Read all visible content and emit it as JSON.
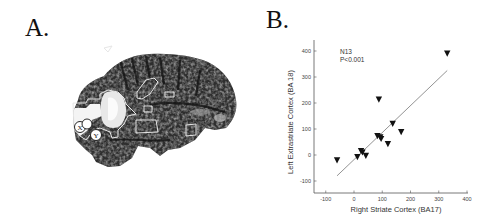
{
  "panels": {
    "a": {
      "label": "A.",
      "circle_labels": [
        "X",
        "Y"
      ]
    },
    "b": {
      "label": "B."
    }
  },
  "chart_data": {
    "type": "scatter",
    "title": "",
    "xlabel": "Right Striate Cortex (BA17)",
    "ylabel": "Left Extrastriate Cortex (BA 18)",
    "xlim": [
      -150,
      400
    ],
    "ylim": [
      -150,
      450
    ],
    "xticks": [
      -100,
      0,
      100,
      200,
      300,
      400
    ],
    "yticks": [
      -100,
      0,
      100,
      200,
      300,
      400
    ],
    "grid": false,
    "marker": "inverted-triangle",
    "annotations": [
      "N13",
      "P<0.001"
    ],
    "series": [
      {
        "name": "subjects",
        "points": [
          {
            "x": -60,
            "y": -20
          },
          {
            "x": 12,
            "y": -8
          },
          {
            "x": 25,
            "y": 15
          },
          {
            "x": 30,
            "y": 10
          },
          {
            "x": 42,
            "y": -3
          },
          {
            "x": 83,
            "y": 73
          },
          {
            "x": 88,
            "y": 213
          },
          {
            "x": 93,
            "y": 68
          },
          {
            "x": 96,
            "y": 62
          },
          {
            "x": 120,
            "y": 42
          },
          {
            "x": 137,
            "y": 120
          },
          {
            "x": 167,
            "y": 88
          },
          {
            "x": 330,
            "y": 390
          }
        ]
      }
    ],
    "regression_line": {
      "x1": -60,
      "y1": -80,
      "x2": 330,
      "y2": 325
    }
  }
}
